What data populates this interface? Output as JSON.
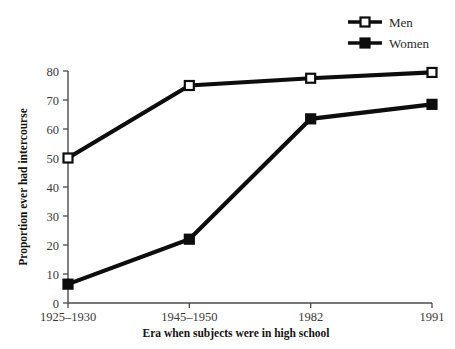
{
  "chart_data": {
    "type": "line",
    "title": "",
    "xlabel": "Era when subjects were in high school",
    "ylabel": "Proportion ever had intercourse",
    "categories": [
      "1925–1930",
      "1945–1950",
      "1982",
      "1991"
    ],
    "yticks": [
      0,
      10,
      20,
      30,
      40,
      50,
      60,
      70,
      80
    ],
    "ylim": [
      0,
      80
    ],
    "grid": false,
    "legend_position": "top-right",
    "series": [
      {
        "name": "Men",
        "marker": "open-square",
        "color": "#0d0d0d",
        "values": [
          50,
          75,
          77.5,
          79.5
        ]
      },
      {
        "name": "Women",
        "marker": "filled-square",
        "color": "#0d0d0d",
        "values": [
          6.5,
          22,
          63.5,
          68.5
        ]
      }
    ]
  }
}
